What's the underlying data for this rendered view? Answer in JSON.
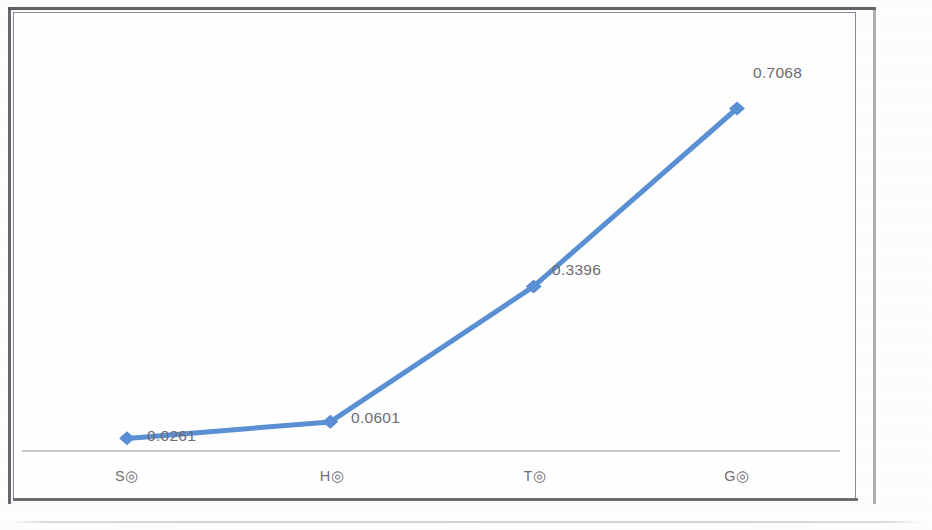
{
  "chart_data": {
    "type": "line",
    "title": "",
    "subtitle": "",
    "xlabel": "",
    "ylabel": "",
    "categories": [
      "S◎",
      "H◎",
      "T◎",
      "G◎"
    ],
    "series": [
      {
        "name": "",
        "values": [
          0.0261,
          0.0601,
          0.3396,
          0.7068
        ],
        "labels": [
          "0.0261",
          "0.0601",
          "0.3396",
          "0.7068"
        ],
        "color": "#5B8FD4",
        "marker": "diamond",
        "line_width": 4
      }
    ],
    "point_labels_shown": true,
    "grid": false,
    "legend": false,
    "legend_position": "none",
    "ylim": [
      0,
      0.78
    ],
    "y_axis_visible": false,
    "x_axis_line_color": "#b9b9bd"
  },
  "axis": {
    "categories": [
      {
        "label": "S◎"
      },
      {
        "label": "H◎"
      },
      {
        "label": "T◎"
      },
      {
        "label": "G◎"
      }
    ]
  },
  "points": [
    {
      "label": "0.0261",
      "value": 0.0261,
      "category": "S◎"
    },
    {
      "label": "0.0601",
      "value": 0.0601,
      "category": "H◎"
    },
    {
      "label": "0.3396",
      "value": 0.3396,
      "category": "T◎"
    },
    {
      "label": "0.7068",
      "value": 0.7068,
      "category": "G◎"
    }
  ],
  "colors": {
    "series": "#5B8FD4",
    "axis_line": "#b9b9bd",
    "label_text": "#6b6b70",
    "frame": "#8a8a90"
  }
}
